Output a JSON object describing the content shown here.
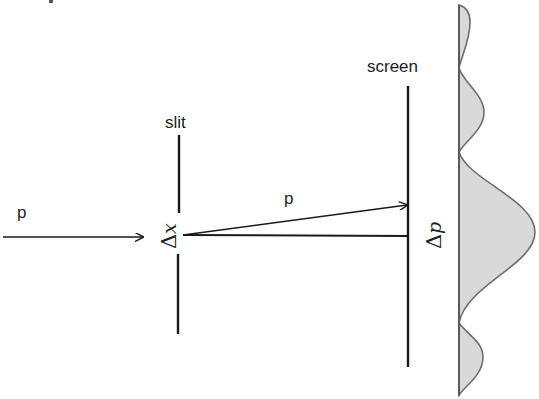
{
  "diagram": {
    "labels": {
      "incoming_momentum": "p",
      "slit": "slit",
      "slit_width_delta": "Δ",
      "slit_width_var": "x",
      "diffracted_momentum": "p",
      "screen": "screen",
      "momentum_spread_delta": "Δ",
      "momentum_spread_var": "p"
    },
    "colors": {
      "line": "#1a1a1a",
      "profile_fill": "#d9d9d9",
      "profile_stroke": "#6e6e6e",
      "background": "#ffffff"
    },
    "intensity_profile": {
      "orientation": "vertical",
      "baseline_x": 459,
      "lobes": [
        {
          "name": "upper-secondary",
          "y_start": 5,
          "y_end": 68,
          "peak_y": 15,
          "peak_x": 469
        },
        {
          "name": "upper-first-order",
          "y_start": 68,
          "y_end": 152,
          "peak_y": 112,
          "peak_x": 484
        },
        {
          "name": "central-maximum",
          "y_start": 152,
          "y_end": 323,
          "peak_y": 232,
          "peak_x": 535
        },
        {
          "name": "lower-first-order",
          "y_start": 323,
          "y_end": 395,
          "peak_y": 357,
          "peak_x": 482
        }
      ]
    }
  }
}
